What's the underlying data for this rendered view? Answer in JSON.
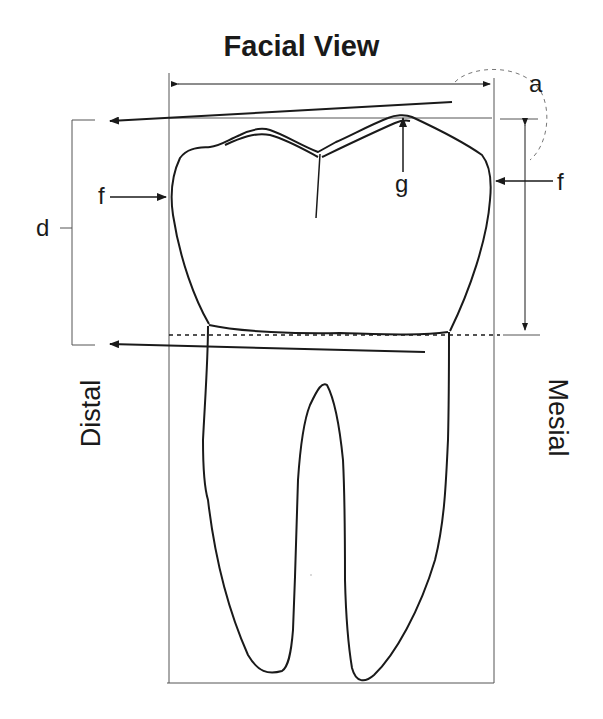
{
  "diagram": {
    "title": "Facial View",
    "labels": {
      "a": "a",
      "d": "d",
      "f_left": "f",
      "f_right": "f",
      "g": "g",
      "distal": "Distal",
      "mesial": "Mesial"
    },
    "colors": {
      "line": "#1a1a1a",
      "box": "#555555",
      "background": "#ffffff"
    }
  }
}
